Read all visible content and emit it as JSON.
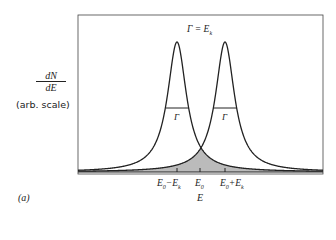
{
  "figure": {
    "panel_label": "(a)",
    "annotation": "Γ = E",
    "annotation_sub": "k",
    "y_label_num": "dN",
    "y_label_den": "dE",
    "y_label_note": "(arb. scale)",
    "x_label": "E",
    "width_label_left": "Γ",
    "width_label_right": "Γ",
    "ticks": [
      {
        "main": "E",
        "sub": "0",
        "rest": "−E",
        "sub2": "k"
      },
      {
        "main": "E",
        "sub": "0",
        "rest": "",
        "sub2": ""
      },
      {
        "main": "E",
        "sub": "0",
        "rest": "+E",
        "sub2": "k"
      }
    ],
    "colors": {
      "curve": "#222222",
      "overlap_fill": "#bbbbbb",
      "frame": "#333333"
    }
  }
}
